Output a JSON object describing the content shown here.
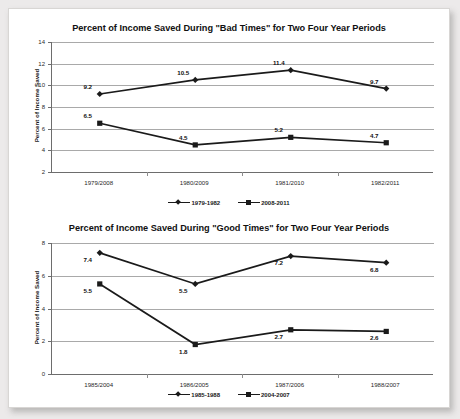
{
  "document": {
    "background_color": "#eceaea",
    "page_color": "#ffffff"
  },
  "chart_data": [
    {
      "id": "bad-times",
      "type": "line",
      "title": "Percent of Income Saved During \"Bad Times\" for Two Four Year Periods",
      "xlabel": "",
      "ylabel": "Percent of Income Saved",
      "categories": [
        "1979/2008",
        "1980/2009",
        "1981/2010",
        "1982/2011"
      ],
      "ylim": [
        2,
        14
      ],
      "yticks": [
        2,
        4,
        6,
        8,
        10,
        12,
        14
      ],
      "grid": true,
      "legend_position": "bottom",
      "series": [
        {
          "name": "1979-1982",
          "marker": "diamond",
          "color": "#1a1a1a",
          "values": [
            9.2,
            10.5,
            11.4,
            9.7
          ],
          "labels": [
            "9.2",
            "10.5",
            "11.4",
            "9.7"
          ]
        },
        {
          "name": "2008-2011",
          "marker": "square",
          "color": "#1a1a1a",
          "values": [
            6.5,
            4.5,
            5.2,
            4.7
          ],
          "labels": [
            "6.5",
            "4.5",
            "5.2",
            "4.7"
          ]
        }
      ]
    },
    {
      "id": "good-times",
      "type": "line",
      "title": "Percent of Income Saved During \"Good Times\" for Two Four Year Periods",
      "xlabel": "",
      "ylabel": "Percent of Income Saved",
      "categories": [
        "1985/2004",
        "1986/2005",
        "1987/2006",
        "1988/2007"
      ],
      "ylim": [
        0,
        8
      ],
      "yticks": [
        0,
        2,
        4,
        6,
        8
      ],
      "grid": true,
      "legend_position": "bottom",
      "series": [
        {
          "name": "1985-1988",
          "marker": "diamond",
          "color": "#1a1a1a",
          "values": [
            7.4,
            5.5,
            7.2,
            6.8
          ],
          "labels": [
            "7.4",
            "5.5",
            "7.2",
            "6.8"
          ]
        },
        {
          "name": "2004-2007",
          "marker": "square",
          "color": "#1a1a1a",
          "values": [
            5.5,
            1.8,
            2.7,
            2.6
          ],
          "labels": [
            "5.5",
            "1.8",
            "2.7",
            "2.6"
          ]
        }
      ]
    }
  ]
}
